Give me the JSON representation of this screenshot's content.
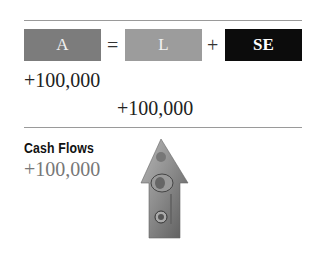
{
  "equation": {
    "assets": {
      "label": "A",
      "color": "#7c7c7c"
    },
    "equals": "=",
    "liabilities": {
      "label": "L",
      "color": "#9c9c9c"
    },
    "plus": "+",
    "equity": {
      "label": "SE",
      "color": "#0c0c0c"
    }
  },
  "effects": {
    "assets_change": "+100,000",
    "equity_change": "+100,000"
  },
  "cash_flows": {
    "title": "Cash Flows",
    "value": "+100,000",
    "icon": "money-up-arrow-icon"
  }
}
